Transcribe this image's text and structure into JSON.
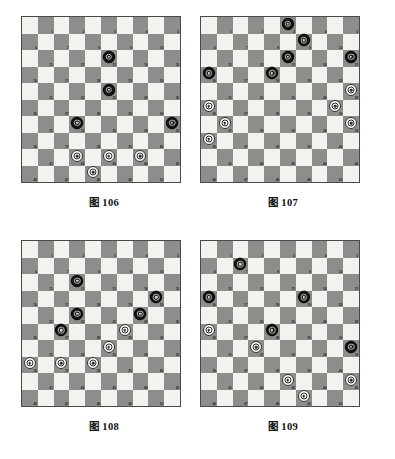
{
  "document": {
    "title": "International draughts diagrams",
    "board_size": 10,
    "numbered_squares": 50,
    "colors": {
      "light_square": "#f4f2ef",
      "dark_square": "#8d8d8d",
      "board_border": "#4a4a4a",
      "black_piece": "#161616",
      "white_piece": "#fbfbfb",
      "page_background": "#ffffff",
      "square_number": "#2b2b2b"
    }
  },
  "figures": [
    {
      "id": "fig-106",
      "caption": "图 106",
      "black": [
        13,
        23,
        32,
        35
      ],
      "white": [
        42,
        43,
        44,
        48
      ]
    },
    {
      "id": "fig-107",
      "caption": "图 107",
      "black": [
        3,
        9,
        13,
        15,
        16,
        18
      ],
      "white": [
        25,
        26,
        30,
        31,
        35,
        36
      ]
    },
    {
      "id": "fig-108",
      "caption": "图 108",
      "black": [
        12,
        20,
        22,
        24,
        27
      ],
      "white": [
        29,
        33,
        36,
        37,
        38
      ]
    },
    {
      "id": "fig-109",
      "caption": "图 109",
      "black": [
        7,
        16,
        19,
        28,
        35
      ],
      "white": [
        26,
        32,
        43,
        45,
        49
      ]
    }
  ]
}
